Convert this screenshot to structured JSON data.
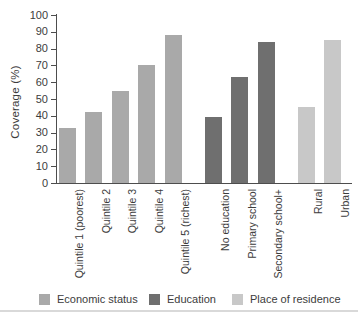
{
  "chart_data": {
    "type": "bar",
    "title": "",
    "xlabel": "",
    "ylabel": "Coverage (%)",
    "ylim": [
      0,
      100
    ],
    "yticks": [
      0,
      10,
      20,
      30,
      40,
      50,
      60,
      70,
      80,
      90,
      100
    ],
    "grid": false,
    "legend_position": "bottom",
    "groups": [
      {
        "name": "Economic status",
        "color": "#a9a9a9",
        "bars": [
          {
            "label": "Quintile 1 (poorest)",
            "value": 33
          },
          {
            "label": "Quintile 2",
            "value": 42
          },
          {
            "label": "Quintile 3",
            "value": 55
          },
          {
            "label": "Quintile 4",
            "value": 70
          },
          {
            "label": "Quintile 5 (richest)",
            "value": 88
          }
        ]
      },
      {
        "name": "Education",
        "color": "#6f6f6f",
        "bars": [
          {
            "label": "No education",
            "value": 39
          },
          {
            "label": "Primary school",
            "value": 63
          },
          {
            "label": "Secondary school+",
            "value": 84
          }
        ]
      },
      {
        "name": "Place of residence",
        "color": "#c8c8c8",
        "bars": [
          {
            "label": "Rural",
            "value": 45
          },
          {
            "label": "Urban",
            "value": 85
          }
        ]
      }
    ]
  }
}
